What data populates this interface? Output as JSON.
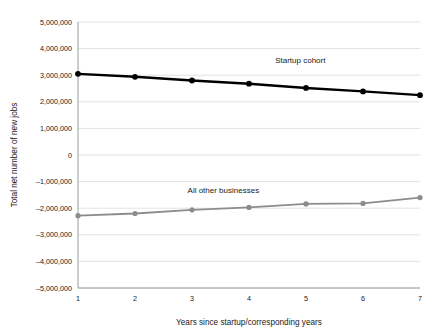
{
  "chart_data": {
    "type": "line",
    "title": "",
    "xlabel": "Years since startup/corresponding years",
    "ylabel": "Total net number of new jobs",
    "x": [
      1,
      2,
      3,
      4,
      5,
      6,
      7
    ],
    "x_tick_labels": [
      "1",
      "2",
      "3",
      "4",
      "5",
      "6",
      "7"
    ],
    "xlim": [
      1,
      7
    ],
    "ylim": [
      -5000000,
      5000000
    ],
    "y_ticks": [
      5000000,
      4000000,
      3000000,
      2000000,
      1000000,
      0,
      -1000000,
      -2000000,
      -3000000,
      -4000000,
      -5000000
    ],
    "y_tick_labels": [
      "5,000,000",
      "4,000,000",
      "3,000,000",
      "2,000,000",
      "1,000,000",
      "0",
      "–1,000,000",
      "–2,000,000",
      "–3,000,000",
      "–4,000,000",
      "–5,000,000"
    ],
    "grid": true,
    "grid_axis": "y",
    "legend_position": "inline-annotation",
    "series": [
      {
        "name": "Startup cohort",
        "color": "#000000",
        "line_width": 2.4,
        "marker": "circle",
        "marker_size": 4.2,
        "label_x": 4.9,
        "label_y": 3450000,
        "values": [
          3050000,
          2940000,
          2800000,
          2680000,
          2520000,
          2390000,
          2250000
        ]
      },
      {
        "name": "All other businesses",
        "color": "#8c8c8c",
        "line_width": 1.8,
        "marker": "circle",
        "marker_size": 3.6,
        "label_x": 3.55,
        "label_y": -1420000,
        "values": [
          -2280000,
          -2200000,
          -2060000,
          -1970000,
          -1840000,
          -1820000,
          -1600000
        ]
      }
    ],
    "colors": {
      "background": "#ffffff",
      "grid": "#e2e2e2",
      "axis": "#9a9a9a",
      "text": "#1a1a1a"
    }
  }
}
